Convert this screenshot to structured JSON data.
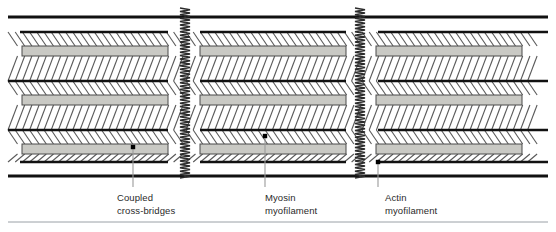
{
  "figure": {
    "type": "anatomical-diagram",
    "background": "#ffffff",
    "width": 556,
    "height": 232
  },
  "colors": {
    "line_dark": "#111111",
    "myosin_fill": "#c9c9c4",
    "myosin_stroke": "#4a4a4a",
    "crossbridge": "#5a5a5a",
    "zline": "#2b2b2b",
    "leader": "#9a9a9a",
    "text": "#2a2a2a",
    "rule": "#9aa0a6"
  },
  "structure": {
    "z_lines": [
      {
        "name": "z-line-left",
        "x": 185,
        "top": 8,
        "bottom": 178
      },
      {
        "name": "z-line-right",
        "x": 360,
        "top": 8,
        "bottom": 178
      }
    ],
    "boundary_lines": [
      {
        "name": "top-boundary-actin",
        "y": 17
      },
      {
        "name": "bottom-boundary-actin",
        "y": 176
      }
    ],
    "actin_rows_y": [
      32,
      81,
      130,
      162
    ],
    "myosin_rows_y": [
      46,
      95,
      144
    ],
    "sarcomere_segments": [
      {
        "name": "segment-left",
        "x0": 8,
        "x1": 185
      },
      {
        "name": "segment-middle",
        "x0": 185,
        "x1": 360
      },
      {
        "name": "segment-right",
        "x0": 360,
        "x1": 548
      }
    ],
    "myosin_bars": [
      {
        "row": 0,
        "x0": 22,
        "x1": 168
      },
      {
        "row": 0,
        "x0": 200,
        "x1": 346
      },
      {
        "row": 0,
        "x0": 376,
        "x1": 522
      },
      {
        "row": 1,
        "x0": 22,
        "x1": 168
      },
      {
        "row": 1,
        "x0": 200,
        "x1": 346
      },
      {
        "row": 1,
        "x0": 376,
        "x1": 522
      },
      {
        "row": 2,
        "x0": 22,
        "x1": 168
      },
      {
        "row": 2,
        "x0": 200,
        "x1": 346
      },
      {
        "row": 2,
        "x0": 376,
        "x1": 522
      }
    ]
  },
  "callouts": [
    {
      "id": "coupled-cross-bridges",
      "line1": "Coupled",
      "line2": "cross-bridges",
      "dot_x": 133,
      "dot_y": 147,
      "text_x": 117,
      "text_y": 192
    },
    {
      "id": "myosin-myofilament",
      "line1": "Myosin",
      "line2": "myofilament",
      "dot_x": 265,
      "dot_y": 136,
      "text_x": 265,
      "text_y": 192
    },
    {
      "id": "actin-myofilament",
      "line1": "Actin",
      "line2": "myofilament",
      "dot_x": 378,
      "dot_y": 162,
      "text_x": 385,
      "text_y": 192
    }
  ],
  "footer_rule": {
    "name": "footer-rule",
    "y": 222,
    "x0": 8,
    "x1": 548
  }
}
